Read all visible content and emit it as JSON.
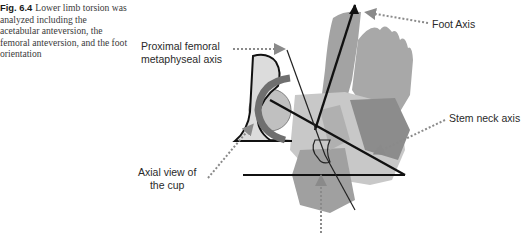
{
  "caption": {
    "figure_number": "Fig. 6.4",
    "text": "Lower limb torsion was analyzed including the acetabular anteversion, the femoral anteversion, and the foot orientation"
  },
  "labels": {
    "proximal_axis_line1": "Proximal femoral",
    "proximal_axis_line2": "metaphyseal axis",
    "foot_axis": "Foot Axis",
    "stem_neck_axis": "Stem neck axis",
    "cup_line1": "Axial view of",
    "cup_line2": "the cup"
  },
  "colors": {
    "text": "#2a2a2a",
    "dotted_arrow": "#8a8a8a",
    "axis_line": "#111111",
    "foot_fill": "#a3a3a3",
    "bone_light": "#c8c8c8",
    "bone_mid": "#b0b0b0",
    "bone_dark": "#8c8c8c",
    "cup_arc": "#7a7a7a"
  }
}
